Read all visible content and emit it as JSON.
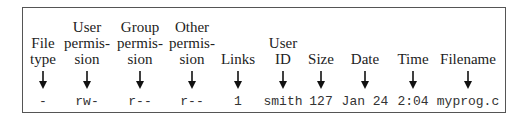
{
  "diagram": {
    "columns": [
      {
        "label_lines": [
          "File",
          "type"
        ],
        "value": "-",
        "x": 20
      },
      {
        "label_lines": [
          "User",
          "permis-",
          "sion"
        ],
        "value": "rw-",
        "x": 64
      },
      {
        "label_lines": [
          "Group",
          "permis-",
          "sion"
        ],
        "value": "r--",
        "x": 117
      },
      {
        "label_lines": [
          "Other",
          "permis-",
          "sion"
        ],
        "value": "r--",
        "x": 169
      },
      {
        "label_lines": [
          "Links"
        ],
        "value": "1",
        "x": 215
      },
      {
        "label_lines": [
          "User",
          "ID"
        ],
        "value": "smith",
        "x": 260
      },
      {
        "label_lines": [
          "Size"
        ],
        "value": "127",
        "x": 298
      },
      {
        "label_lines": [
          "Date"
        ],
        "value": "Jan 24",
        "x": 342
      },
      {
        "label_lines": [
          "Time"
        ],
        "value": "2:04",
        "x": 390
      },
      {
        "label_lines": [
          "Filename"
        ],
        "value": "myprog.c",
        "x": 445
      }
    ],
    "arrow_icon": "down-arrow-icon"
  }
}
